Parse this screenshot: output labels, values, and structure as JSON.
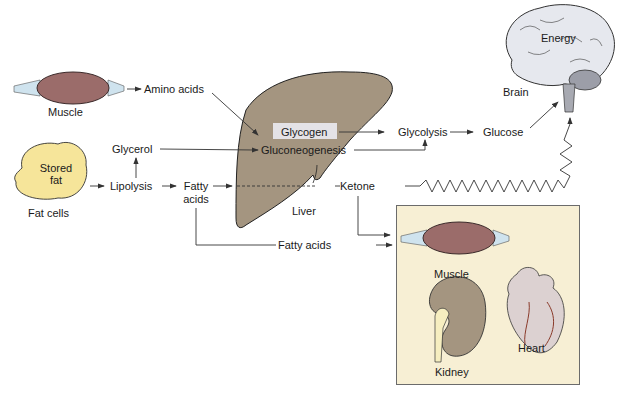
{
  "colors": {
    "liver": "#a49580",
    "muscle": "#9b6c6a",
    "fat": "#f6e59a",
    "panel": "#f7efd4",
    "kidney": "#a49580",
    "heart": "#dcd1d1",
    "brain": "#e6e8ee",
    "arrow": "#333333"
  },
  "labels": {
    "muscle_top": "Muscle",
    "amino_acids": "Amino acids",
    "glycerol": "Glycerol",
    "stored_fat_line1": "Stored",
    "stored_fat_line2": "fat",
    "fat_cells": "Fat cells",
    "lipolysis": "Lipolysis",
    "fatty_line1": "Fatty",
    "fatty_line2": "acids",
    "glycogen": "Glycogen",
    "gluconeogenesis": "Gluconeogenesis",
    "liver": "Liver",
    "ketone": "Ketone",
    "glycolysis": "Glycolysis",
    "glucose": "Glucose",
    "brain": "Brain",
    "energy": "Energy",
    "fatty_acids_bottom": "Fatty acids",
    "muscle_panel": "Muscle",
    "kidney": "Kidney",
    "heart": "Heart"
  }
}
